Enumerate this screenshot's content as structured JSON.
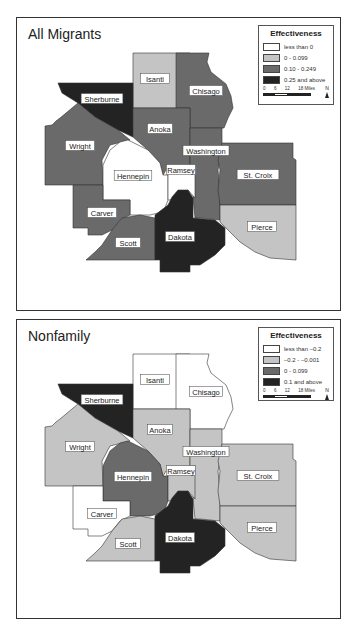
{
  "classes": {
    "c0": "#ffffff",
    "c1": "#c4c4c4",
    "c2": "#6a6a6a",
    "c3": "#232323"
  },
  "panels": [
    {
      "title": "All Migrants",
      "legend": {
        "title": "Effectiveness",
        "items": [
          {
            "label": "less than 0",
            "color": "#ffffff"
          },
          {
            "label": "0 - 0.099",
            "color": "#c4c4c4"
          },
          {
            "label": "0.10 - 0.249",
            "color": "#6a6a6a"
          },
          {
            "label": "0.25 and above",
            "color": "#232323"
          }
        ],
        "scale": {
          "ticks": [
            "0",
            "6",
            "12",
            "18 Miles"
          ],
          "north": "N"
        }
      },
      "counties": {
        "Isanti": "c1",
        "Chisago": "c2",
        "Sherburne": "c3",
        "Anoka": "c2",
        "Washington": "c2",
        "Wright": "c2",
        "Hennepin": "c0",
        "Ramsey": "c0",
        "Carver": "c2",
        "Scott": "c2",
        "Dakota": "c3",
        "St. Croix": "c2",
        "Pierce": "c1"
      }
    },
    {
      "title": "Nonfamily",
      "legend": {
        "title": "Effectiveness",
        "items": [
          {
            "label": "less than –0.2",
            "color": "#ffffff"
          },
          {
            "label": "–0.2 - –0.001",
            "color": "#c4c4c4"
          },
          {
            "label": "0 - 0.099",
            "color": "#6a6a6a"
          },
          {
            "label": "0.1 and above",
            "color": "#232323"
          }
        ],
        "scale": {
          "ticks": [
            "0",
            "6",
            "12",
            "18 Miles"
          ],
          "north": "N"
        }
      },
      "counties": {
        "Isanti": "c0",
        "Chisago": "c0",
        "Sherburne": "c3",
        "Anoka": "c1",
        "Washington": "c1",
        "Wright": "c1",
        "Hennepin": "c2",
        "Ramsey": "c1",
        "Carver": "c0",
        "Scott": "c1",
        "Dakota": "c3",
        "St. Croix": "c1",
        "Pierce": "c1"
      }
    }
  ],
  "geometry": {
    "Isanti": {
      "points": "133,53 190,53 190,108 133,108",
      "label": [
        155,
        79
      ]
    },
    "Chisago": {
      "points": "176,53 209,53 207,62 211,72 226,84 231,96 233,108 228,118 224,128 190,128 190,108 176,108",
      "label": [
        206,
        91
      ]
    },
    "Sherburne": {
      "points": "58,83 133,83 133,137 118,130 95,117 78,103 62,93",
      "label": [
        102,
        99
      ]
    },
    "Anoka": {
      "points": "133,108 190,108 190,128 190,170 166,170 163,175 160,163 148,150 133,137",
      "label": [
        160,
        129
      ]
    },
    "Washington": {
      "points": "190,128 222,128 222,143 220,160 218,170 220,190 220,220 200,218 195,218 193,198 195,165 190,165",
      "label": [
        206,
        151
      ]
    },
    "Wright": {
      "points": "45,126 52,125 56,121 60,118 78,103 95,117 118,130 130,140 110,145 102,160 103,185 73,185 45,185",
      "label": [
        80,
        146
      ]
    },
    "Hennepin": {
      "points": "103,165 110,150 120,142 128,140 138,145 148,150 160,163 163,175 168,175 168,200 165,208 158,213 150,215 130,215 130,200 103,200",
      "label": [
        133,
        176
      ]
    },
    "Ramsey": {
      "points": "168,165 195,165 195,198 188,190 178,195 170,200 168,200",
      "label": [
        181,
        170
      ]
    },
    "Carver": {
      "points": "73,185 103,185 103,200 130,200 130,215 120,220 112,230 102,235 88,235 88,228 73,228",
      "label": [
        102,
        213
      ]
    },
    "Scott": {
      "points": "86,260 95,252 102,245 112,230 122,218 140,215 155,218 155,260",
      "label": [
        128,
        243
      ]
    },
    "Dakota": {
      "points": "155,215 168,205 172,197 178,190 188,190 193,198 193,218 215,220 225,228 225,245 215,255 200,265 190,265 190,272 160,272 160,260 155,260",
      "label": [
        180,
        237
      ]
    },
    "St. Croix": {
      "points": "222,143 293,143 293,158 296,160 296,205 220,205 218,190 220,170 218,160",
      "label": [
        258,
        175
      ]
    },
    "Pierce": {
      "points": "220,205 296,205 296,260 270,258 255,252 240,242 230,232 220,222",
      "label": [
        262,
        227
      ]
    }
  }
}
